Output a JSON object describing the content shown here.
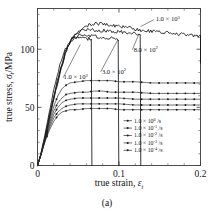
{
  "figure": {
    "caption": "(a)"
  },
  "chart_data": {
    "type": "line",
    "title": "",
    "xlabel": "true strain, ε",
    "xlabel_sub": "t",
    "ylabel": "true stress, σ",
    "ylabel_sub": "t",
    "ylabel_unit": "/MPa",
    "xlim": [
      0,
      0.2
    ],
    "ylim": [
      0,
      135
    ],
    "xticks": [
      0,
      0.1,
      0.2
    ],
    "xtick_labels": [
      "0",
      "0.1",
      "0.2"
    ],
    "yticks": [
      0,
      50,
      100
    ],
    "ytick_labels": [
      "0",
      "50",
      "100"
    ],
    "x_minor_step": 0.02,
    "y_minor_step": 10,
    "grid": false,
    "legend_position": "lower right",
    "legend_title": "",
    "series": [
      {
        "name": "1.0 × 10³ /s",
        "mantissa": "1.0",
        "base": "10",
        "exponent": "3",
        "unit": "/s",
        "label_kind": "annotation",
        "annotation_x": 0.145,
        "annotation_y": 124,
        "style": "noisy-line",
        "markers": false,
        "peak_stress": 122,
        "plateau_stress": 112,
        "fracture_strain": 0.2,
        "points": [
          [
            0,
            0
          ],
          [
            0.004,
            9
          ],
          [
            0.009,
            22
          ],
          [
            0.014,
            38
          ],
          [
            0.019,
            54
          ],
          [
            0.024,
            69
          ],
          [
            0.029,
            83
          ],
          [
            0.034,
            95
          ],
          [
            0.039,
            104
          ],
          [
            0.044,
            111
          ],
          [
            0.049,
            115
          ],
          [
            0.055,
            118
          ],
          [
            0.06,
            120
          ],
          [
            0.066,
            121
          ],
          [
            0.072,
            122
          ],
          [
            0.078,
            122
          ],
          [
            0.085,
            121
          ],
          [
            0.095,
            120
          ],
          [
            0.105,
            119
          ],
          [
            0.115,
            118
          ],
          [
            0.13,
            116
          ],
          [
            0.145,
            115
          ],
          [
            0.16,
            114
          ],
          [
            0.175,
            113
          ],
          [
            0.19,
            112
          ],
          [
            0.2,
            111
          ]
        ]
      },
      {
        "name": "8.0 × 10² /s",
        "mantissa": "8.0",
        "base": "10",
        "exponent": "2",
        "unit": "/s",
        "label_kind": "annotation",
        "annotation_x": 0.118,
        "annotation_y": 98,
        "style": "noisy-line",
        "markers": false,
        "peak_stress": 117,
        "plateau_stress": 114,
        "fracture_strain": 0.126,
        "points": [
          [
            0,
            0
          ],
          [
            0.004,
            9
          ],
          [
            0.009,
            23
          ],
          [
            0.014,
            39
          ],
          [
            0.019,
            55
          ],
          [
            0.024,
            70
          ],
          [
            0.029,
            84
          ],
          [
            0.034,
            96
          ],
          [
            0.039,
            105
          ],
          [
            0.044,
            111
          ],
          [
            0.049,
            114
          ],
          [
            0.055,
            116
          ],
          [
            0.06,
            117
          ],
          [
            0.066,
            117
          ],
          [
            0.072,
            116
          ],
          [
            0.08,
            116
          ],
          [
            0.09,
            115
          ],
          [
            0.1,
            115
          ],
          [
            0.11,
            114
          ],
          [
            0.12,
            114
          ],
          [
            0.126,
            113
          ]
        ]
      },
      {
        "name": "3.0 × 10² /s",
        "mantissa": "3.0",
        "base": "10",
        "exponent": "2",
        "unit": "/s",
        "label_kind": "annotation",
        "annotation_x": 0.079,
        "annotation_y": 79,
        "style": "noisy-line",
        "markers": false,
        "peak_stress": 112,
        "plateau_stress": 109,
        "fracture_strain": 0.099,
        "points": [
          [
            0,
            0
          ],
          [
            0.004,
            9
          ],
          [
            0.009,
            24
          ],
          [
            0.014,
            41
          ],
          [
            0.019,
            57
          ],
          [
            0.024,
            72
          ],
          [
            0.029,
            86
          ],
          [
            0.034,
            97
          ],
          [
            0.039,
            105
          ],
          [
            0.044,
            109
          ],
          [
            0.049,
            111
          ],
          [
            0.055,
            112
          ],
          [
            0.06,
            112
          ],
          [
            0.066,
            111
          ],
          [
            0.073,
            111
          ],
          [
            0.08,
            110
          ],
          [
            0.088,
            110
          ],
          [
            0.094,
            109
          ],
          [
            0.099,
            109
          ]
        ]
      },
      {
        "name": "1.0 × 10² /s",
        "mantissa": "1.0",
        "base": "10",
        "exponent": "2",
        "unit": "/s",
        "label_kind": "annotation",
        "annotation_x": 0.032,
        "annotation_y": 74,
        "style": "noisy-line",
        "markers": false,
        "peak_stress": 110,
        "plateau_stress": 108,
        "fracture_strain": 0.066,
        "points": [
          [
            0,
            0
          ],
          [
            0.004,
            10
          ],
          [
            0.009,
            26
          ],
          [
            0.014,
            44
          ],
          [
            0.019,
            61
          ],
          [
            0.024,
            77
          ],
          [
            0.029,
            90
          ],
          [
            0.034,
            100
          ],
          [
            0.039,
            106
          ],
          [
            0.044,
            109
          ],
          [
            0.049,
            110
          ],
          [
            0.054,
            110
          ],
          [
            0.059,
            109
          ],
          [
            0.063,
            109
          ],
          [
            0.066,
            108
          ]
        ]
      },
      {
        "name": "1.0 × 10⁰ /s",
        "mantissa": "1.0",
        "base": "10",
        "exponent": "0",
        "unit": "/s",
        "label_kind": "legend",
        "style": "marker-line",
        "markers": true,
        "plateau_stress": 71,
        "points": [
          [
            0,
            0
          ],
          [
            0.005,
            11
          ],
          [
            0.01,
            25
          ],
          [
            0.015,
            39
          ],
          [
            0.02,
            51
          ],
          [
            0.025,
            60
          ],
          [
            0.03,
            66
          ],
          [
            0.035,
            69
          ],
          [
            0.04,
            71
          ],
          [
            0.05,
            72
          ],
          [
            0.06,
            73
          ],
          [
            0.07,
            73
          ],
          [
            0.08,
            73
          ],
          [
            0.09,
            73
          ],
          [
            0.1,
            72
          ],
          [
            0.12,
            72
          ],
          [
            0.14,
            71
          ],
          [
            0.16,
            71
          ],
          [
            0.18,
            71
          ],
          [
            0.2,
            71
          ]
        ]
      },
      {
        "name": "1.0 × 10⁻¹ /s",
        "mantissa": "1.0",
        "base": "10",
        "exponent": "-1",
        "unit": "/s",
        "label_kind": "legend",
        "style": "marker-line",
        "markers": true,
        "plateau_stress": 62,
        "points": [
          [
            0,
            0
          ],
          [
            0.005,
            11
          ],
          [
            0.01,
            25
          ],
          [
            0.015,
            37
          ],
          [
            0.02,
            47
          ],
          [
            0.025,
            54
          ],
          [
            0.03,
            58
          ],
          [
            0.035,
            61
          ],
          [
            0.04,
            62
          ],
          [
            0.05,
            63
          ],
          [
            0.06,
            63
          ],
          [
            0.07,
            64
          ],
          [
            0.08,
            64
          ],
          [
            0.09,
            63
          ],
          [
            0.1,
            63
          ],
          [
            0.12,
            63
          ],
          [
            0.14,
            62
          ],
          [
            0.16,
            62
          ],
          [
            0.18,
            62
          ],
          [
            0.2,
            62
          ]
        ]
      },
      {
        "name": "1.0 × 10⁻² /s",
        "mantissa": "1.0",
        "base": "10",
        "exponent": "-2",
        "unit": "/s",
        "label_kind": "legend",
        "style": "marker-line",
        "markers": true,
        "plateau_stress": 57,
        "points": [
          [
            0,
            0
          ],
          [
            0.005,
            11
          ],
          [
            0.01,
            24
          ],
          [
            0.015,
            35
          ],
          [
            0.02,
            44
          ],
          [
            0.025,
            50
          ],
          [
            0.03,
            54
          ],
          [
            0.035,
            56
          ],
          [
            0.04,
            57
          ],
          [
            0.05,
            58
          ],
          [
            0.06,
            58
          ],
          [
            0.07,
            58
          ],
          [
            0.08,
            58
          ],
          [
            0.09,
            58
          ],
          [
            0.1,
            58
          ],
          [
            0.12,
            57
          ],
          [
            0.14,
            57
          ],
          [
            0.16,
            57
          ],
          [
            0.18,
            57
          ],
          [
            0.2,
            57
          ]
        ]
      },
      {
        "name": "1.0 × 10⁻³ /s",
        "mantissa": "1.0",
        "base": "10",
        "exponent": "-3",
        "unit": "/s",
        "label_kind": "legend",
        "style": "marker-line",
        "markers": true,
        "plateau_stress": 52,
        "points": [
          [
            0,
            0
          ],
          [
            0.005,
            11
          ],
          [
            0.01,
            23
          ],
          [
            0.015,
            33
          ],
          [
            0.02,
            41
          ],
          [
            0.025,
            46
          ],
          [
            0.03,
            49
          ],
          [
            0.035,
            51
          ],
          [
            0.04,
            52
          ],
          [
            0.05,
            53
          ],
          [
            0.06,
            53
          ],
          [
            0.07,
            53
          ],
          [
            0.08,
            53
          ],
          [
            0.09,
            53
          ],
          [
            0.1,
            53
          ],
          [
            0.12,
            52
          ],
          [
            0.14,
            52
          ],
          [
            0.16,
            52
          ],
          [
            0.18,
            52
          ],
          [
            0.2,
            52
          ]
        ]
      },
      {
        "name": "1.0 × 10⁻⁴ /s",
        "mantissa": "1.0",
        "base": "10",
        "exponent": "-4",
        "unit": "/s",
        "label_kind": "legend",
        "style": "marker-line",
        "markers": true,
        "plateau_stress": 48,
        "points": [
          [
            0,
            0
          ],
          [
            0.005,
            11
          ],
          [
            0.01,
            22
          ],
          [
            0.015,
            31
          ],
          [
            0.02,
            38
          ],
          [
            0.025,
            43
          ],
          [
            0.03,
            46
          ],
          [
            0.035,
            47
          ],
          [
            0.04,
            48
          ],
          [
            0.05,
            48
          ],
          [
            0.06,
            49
          ],
          [
            0.07,
            49
          ],
          [
            0.08,
            49
          ],
          [
            0.09,
            49
          ],
          [
            0.1,
            48
          ],
          [
            0.12,
            48
          ],
          [
            0.14,
            48
          ],
          [
            0.16,
            48
          ],
          [
            0.18,
            48
          ],
          [
            0.2,
            48
          ]
        ]
      }
    ],
    "annotations": [
      {
        "text": "1.0 × 10",
        "exponent": "3",
        "x": 0.145,
        "y": 124
      },
      {
        "text": "8.0 × 10",
        "exponent": "2",
        "x": 0.118,
        "y": 98
      },
      {
        "text": "3.0 × 10",
        "exponent": "2",
        "x": 0.079,
        "y": 79
      },
      {
        "text": "1.0 × 10",
        "exponent": "2",
        "x": 0.032,
        "y": 74
      }
    ],
    "legend_entries": [
      {
        "mantissa": "1.0 × 10",
        "exponent": "0",
        "unit": "/s"
      },
      {
        "mantissa": "1.0 × 10",
        "exponent": "-1",
        "unit": "/s"
      },
      {
        "mantissa": "1.0 × 10",
        "exponent": "-2",
        "unit": "/s"
      },
      {
        "mantissa": "1.0 × 10",
        "exponent": "-3",
        "unit": "/s"
      },
      {
        "mantissa": "1.0 × 10",
        "exponent": "-4",
        "unit": "/s"
      }
    ]
  }
}
